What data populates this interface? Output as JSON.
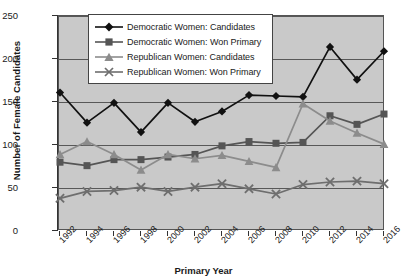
{
  "chart_data": {
    "type": "line",
    "title": "",
    "xlabel": "Primary Year",
    "ylabel": "Number of Female Candidates",
    "categories": [
      "1992",
      "1994",
      "1996",
      "1998",
      "2000",
      "2002",
      "2004",
      "2006",
      "2008",
      "2010",
      "2012",
      "2014",
      "2016"
    ],
    "x": [
      1992,
      1994,
      1996,
      1998,
      2000,
      2002,
      2004,
      2006,
      2008,
      2010,
      2012,
      2014,
      2016
    ],
    "ylim": [
      0,
      250
    ],
    "yticks": [
      0,
      50,
      100,
      150,
      200,
      250
    ],
    "grid": true,
    "legend_position": "upper-center",
    "series": [
      {
        "name": "Democratic Women: Candidates",
        "marker": "diamond",
        "color": "#111111",
        "values": [
          161,
          126,
          149,
          115,
          149,
          127,
          139,
          158,
          157,
          156,
          214,
          176,
          209
        ]
      },
      {
        "name": "Democratic Women: Won Primary",
        "marker": "square",
        "color": "#555555",
        "values": [
          80,
          76,
          83,
          83,
          86,
          89,
          99,
          104,
          102,
          103,
          134,
          124,
          136
        ]
      },
      {
        "name": "Republican Women: Candidates",
        "marker": "triangle",
        "color": "#8c8c8c",
        "values": [
          89,
          104,
          89,
          71,
          89,
          84,
          88,
          81,
          74,
          148,
          128,
          114,
          101
        ]
      },
      {
        "name": "Republican Women: Won Primary",
        "marker": "x",
        "color": "#6e6e6e",
        "values": [
          38,
          46,
          47,
          51,
          46,
          51,
          55,
          49,
          43,
          54,
          57,
          58,
          55
        ]
      }
    ]
  },
  "style": {
    "plot_background": "#c9c9c9",
    "grid_color": "#585858",
    "axis_color": "#333333",
    "legend_background": "#ffffff"
  }
}
